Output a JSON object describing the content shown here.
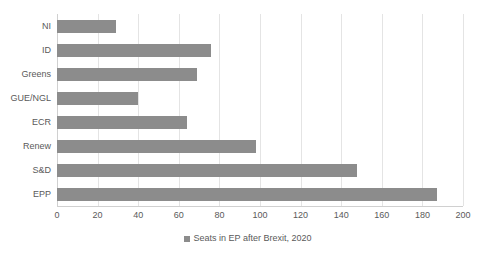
{
  "chart_data": {
    "type": "bar",
    "orientation": "horizontal",
    "title": "",
    "xlabel": "",
    "ylabel": "",
    "categories": [
      "NI",
      "ID",
      "Greens",
      "GUE/NGL",
      "ECR",
      "Renew",
      "S&D",
      "EPP"
    ],
    "values": [
      29,
      76,
      69,
      40,
      64,
      98,
      148,
      187
    ],
    "series": [
      {
        "name": "Seats in EP after Brexit, 2020",
        "values": [
          29,
          76,
          69,
          40,
          64,
          98,
          148,
          187
        ],
        "color": "#8c8c8c"
      }
    ],
    "xlim": [
      0,
      200
    ],
    "xticks": [
      0,
      20,
      40,
      60,
      80,
      100,
      120,
      140,
      160,
      180,
      200
    ],
    "xtick_labels": [
      "0",
      "20",
      "40",
      "60",
      "80",
      "100",
      "120",
      "140",
      "160",
      "180",
      "200"
    ],
    "grid": true,
    "grid_axis": "x",
    "legend": {
      "position": "bottom",
      "entries": [
        {
          "label": "Seats in EP after Brexit, 2020",
          "color": "#8c8c8c",
          "marker": "square-swatch"
        }
      ]
    },
    "colors": {
      "bar": "#8c8c8c",
      "gridline": "#e4e4e4",
      "axis": "#d0d0d0",
      "text": "#5a5a5a",
      "background": "#ffffff"
    }
  }
}
